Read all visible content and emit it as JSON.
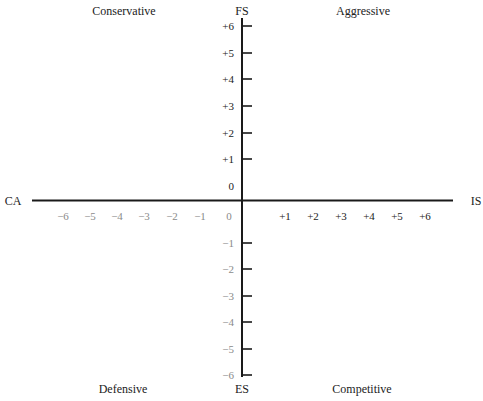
{
  "chart_data": {
    "type": "quadrant",
    "title": "",
    "axes": {
      "horizontal": {
        "left_label": "CA",
        "right_label": "IS",
        "range": [
          -6,
          6
        ],
        "negative_ticks": [
          "−6",
          "−5",
          "−4",
          "−3",
          "−2",
          "−1",
          "0"
        ],
        "positive_ticks": [
          "+1",
          "+2",
          "+3",
          "+4",
          "+5",
          "+6"
        ]
      },
      "vertical": {
        "top_label": "FS",
        "bottom_label": "ES",
        "range": [
          -6,
          6
        ],
        "positive_ticks": [
          "+6",
          "+5",
          "+4",
          "+3",
          "+2",
          "+1",
          "0"
        ],
        "negative_ticks": [
          "−1",
          "−2",
          "−3",
          "−4",
          "−5",
          "−6"
        ]
      }
    },
    "quadrants": {
      "top_left": "Conservative",
      "top_right": "Aggressive",
      "bottom_left": "Defensive",
      "bottom_right": "Competitive"
    },
    "grid": false
  },
  "colors": {
    "axis": "#1a1a1a",
    "dark_text": "#222222",
    "grey_text": "#8a8a8a"
  }
}
